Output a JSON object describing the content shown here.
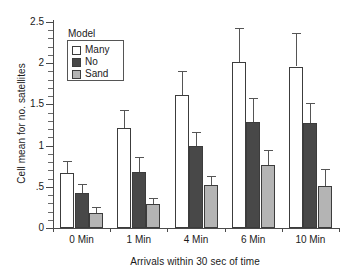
{
  "chart_data": {
    "type": "bar",
    "title": "",
    "xlabel": "Arrivals within 30 sec of time",
    "ylabel": "Cell mean for no. satellites",
    "categories": [
      "0 Min",
      "1 Min",
      "4 Min",
      "6 Min",
      "10 Min"
    ],
    "ylim": [
      0,
      2.5
    ],
    "ytick_labels": [
      "0",
      ".5",
      "1",
      "1.5",
      "2",
      "2.5"
    ],
    "ytick_values": [
      0,
      0.5,
      1,
      1.5,
      2,
      2.5
    ],
    "yminor_step": 0.1,
    "grid": false,
    "legend_title": "Model",
    "legend_position": "upper-left-inside",
    "series": [
      {
        "name": "Many",
        "color": "#ffffff",
        "values": [
          0.67,
          1.21,
          1.61,
          2.02,
          1.96
        ],
        "errors": [
          0.14,
          0.22,
          0.29,
          0.41,
          0.41
        ]
      },
      {
        "name": "No",
        "color": "#484848",
        "values": [
          0.43,
          0.68,
          0.99,
          1.29,
          1.27
        ],
        "errors": [
          0.11,
          0.18,
          0.17,
          0.29,
          0.25
        ]
      },
      {
        "name": "Sand",
        "color": "#b4b4b4",
        "values": [
          0.18,
          0.29,
          0.52,
          0.76,
          0.51
        ]
      }
    ],
    "sand_errors": [
      0.07,
      0.07,
      0.11,
      0.19,
      0.21
    ]
  },
  "axis": {
    "y_title": "Cell mean for no. satellites",
    "x_title": "Arrivals within 30 sec of time"
  },
  "legend": {
    "title": "Model",
    "items": [
      {
        "label": "Many"
      },
      {
        "label": "No"
      },
      {
        "label": "Sand"
      }
    ]
  },
  "yticks": [
    {
      "label": "2.5"
    },
    {
      "label": "2"
    },
    {
      "label": "1.5"
    },
    {
      "label": "1"
    },
    {
      "label": ".5"
    },
    {
      "label": "0"
    }
  ],
  "xticks": [
    {
      "label": "0 Min"
    },
    {
      "label": "1 Min"
    },
    {
      "label": "4 Min"
    },
    {
      "label": "6 Min"
    },
    {
      "label": "10 Min"
    }
  ]
}
